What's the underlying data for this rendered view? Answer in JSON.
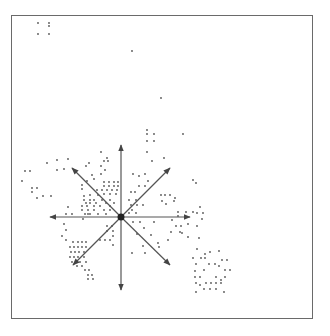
{
  "diagram": {
    "type": "scatter-with-direction-star",
    "frame": {
      "x": 11,
      "y": 15,
      "width": 302,
      "height": 304,
      "stroke": "#6a6a6a"
    },
    "colors": {
      "dot": "#555555",
      "arrow": "#555555",
      "center": "#222222"
    },
    "star": {
      "center": [
        121,
        217
      ],
      "arrows": [
        {
          "name": "north",
          "to": [
            121,
            145
          ]
        },
        {
          "name": "south",
          "to": [
            121,
            290
          ]
        },
        {
          "name": "west",
          "to": [
            50,
            217
          ]
        },
        {
          "name": "east",
          "to": [
            190,
            217
          ]
        },
        {
          "name": "north-west",
          "to": [
            72,
            168
          ]
        },
        {
          "name": "north-east",
          "to": [
            170,
            168
          ]
        },
        {
          "name": "south-west",
          "to": [
            73,
            265
          ]
        },
        {
          "name": "south-east",
          "to": [
            170,
            265
          ]
        }
      ]
    },
    "dots": [
      [
        38,
        23
      ],
      [
        49,
        23
      ],
      [
        49,
        26
      ],
      [
        38,
        34
      ],
      [
        49,
        34
      ],
      [
        132,
        51
      ],
      [
        161,
        98
      ],
      [
        147,
        130
      ],
      [
        147,
        134
      ],
      [
        154,
        134
      ],
      [
        147,
        141
      ],
      [
        154,
        141
      ],
      [
        147,
        152
      ],
      [
        183,
        134
      ],
      [
        164,
        158
      ],
      [
        152,
        161
      ],
      [
        57,
        170
      ],
      [
        64,
        169
      ],
      [
        68,
        159
      ],
      [
        57,
        160
      ],
      [
        47,
        163
      ],
      [
        25,
        171
      ],
      [
        30,
        171
      ],
      [
        22,
        181
      ],
      [
        101,
        152
      ],
      [
        107,
        158
      ],
      [
        104,
        161
      ],
      [
        101,
        166
      ],
      [
        108,
        161
      ],
      [
        105,
        170
      ],
      [
        101,
        174
      ],
      [
        86,
        166
      ],
      [
        89,
        163
      ],
      [
        92,
        175
      ],
      [
        87,
        181
      ],
      [
        94,
        179
      ],
      [
        82,
        185
      ],
      [
        82,
        189
      ],
      [
        104,
        182
      ],
      [
        109,
        182
      ],
      [
        114,
        182
      ],
      [
        118,
        182
      ],
      [
        104,
        186
      ],
      [
        109,
        186
      ],
      [
        114,
        186
      ],
      [
        118,
        186
      ],
      [
        97,
        190
      ],
      [
        102,
        190
      ],
      [
        107,
        190
      ],
      [
        112,
        190
      ],
      [
        117,
        190
      ],
      [
        90,
        195
      ],
      [
        98,
        195
      ],
      [
        104,
        194
      ],
      [
        110,
        194
      ],
      [
        116,
        194
      ],
      [
        32,
        188
      ],
      [
        32,
        192
      ],
      [
        37,
        188
      ],
      [
        37,
        198
      ],
      [
        43,
        196
      ],
      [
        51,
        196
      ],
      [
        84,
        196
      ],
      [
        84,
        200
      ],
      [
        90,
        200
      ],
      [
        94,
        200
      ],
      [
        102,
        200
      ],
      [
        110,
        200
      ],
      [
        86,
        203
      ],
      [
        90,
        203
      ],
      [
        96,
        203
      ],
      [
        106,
        203
      ],
      [
        114,
        203
      ],
      [
        82,
        206
      ],
      [
        87,
        206
      ],
      [
        94,
        206
      ],
      [
        100,
        206
      ],
      [
        110,
        206
      ],
      [
        82,
        210
      ],
      [
        88,
        210
      ],
      [
        94,
        210
      ],
      [
        104,
        210
      ],
      [
        110,
        210
      ],
      [
        85,
        214
      ],
      [
        90,
        214
      ],
      [
        98,
        214
      ],
      [
        106,
        214
      ],
      [
        68,
        207
      ],
      [
        72,
        214
      ],
      [
        66,
        214
      ],
      [
        83,
        219
      ],
      [
        88,
        214
      ],
      [
        133,
        174
      ],
      [
        139,
        176
      ],
      [
        145,
        174
      ],
      [
        148,
        181
      ],
      [
        139,
        186
      ],
      [
        145,
        186
      ],
      [
        131,
        192
      ],
      [
        135,
        192
      ],
      [
        129,
        200
      ],
      [
        136,
        200
      ],
      [
        131,
        205
      ],
      [
        137,
        205
      ],
      [
        143,
        205
      ],
      [
        132,
        210
      ],
      [
        129,
        213
      ],
      [
        136,
        213
      ],
      [
        161,
        195
      ],
      [
        165,
        195
      ],
      [
        170,
        195
      ],
      [
        175,
        198
      ],
      [
        162,
        201
      ],
      [
        166,
        204
      ],
      [
        174,
        201
      ],
      [
        178,
        212
      ],
      [
        178,
        216
      ],
      [
        186,
        212
      ],
      [
        186,
        217
      ],
      [
        193,
        212
      ],
      [
        200,
        207
      ],
      [
        197,
        213
      ],
      [
        203,
        213
      ],
      [
        202,
        219
      ],
      [
        197,
        226
      ],
      [
        196,
        183
      ],
      [
        193,
        180
      ],
      [
        64,
        224
      ],
      [
        66,
        230
      ],
      [
        62,
        236
      ],
      [
        66,
        240
      ],
      [
        107,
        226
      ],
      [
        112,
        226
      ],
      [
        107,
        231
      ],
      [
        113,
        231
      ],
      [
        100,
        240
      ],
      [
        105,
        240
      ],
      [
        110,
        240
      ],
      [
        113,
        236
      ],
      [
        113,
        245
      ],
      [
        133,
        222
      ],
      [
        140,
        222
      ],
      [
        144,
        228
      ],
      [
        137,
        234
      ],
      [
        151,
        235
      ],
      [
        154,
        222
      ],
      [
        172,
        220
      ],
      [
        176,
        226
      ],
      [
        171,
        232
      ],
      [
        168,
        240
      ],
      [
        159,
        247
      ],
      [
        181,
        226
      ],
      [
        188,
        224
      ],
      [
        182,
        233
      ],
      [
        188,
        237
      ],
      [
        143,
        246
      ],
      [
        158,
        243
      ],
      [
        180,
        232
      ],
      [
        73,
        242
      ],
      [
        78,
        242
      ],
      [
        82,
        242
      ],
      [
        86,
        242
      ],
      [
        70,
        247
      ],
      [
        74,
        247
      ],
      [
        78,
        247
      ],
      [
        82,
        247
      ],
      [
        86,
        247
      ],
      [
        71,
        252
      ],
      [
        75,
        252
      ],
      [
        79,
        252
      ],
      [
        84,
        252
      ],
      [
        70,
        257
      ],
      [
        74,
        257
      ],
      [
        78,
        257
      ],
      [
        84,
        257
      ],
      [
        72,
        262
      ],
      [
        80,
        262
      ],
      [
        86,
        262
      ],
      [
        77,
        266
      ],
      [
        82,
        266
      ],
      [
        85,
        270
      ],
      [
        89,
        270
      ],
      [
        88,
        275
      ],
      [
        92,
        275
      ],
      [
        88,
        279
      ],
      [
        93,
        279
      ],
      [
        132,
        253
      ],
      [
        145,
        253
      ],
      [
        199,
        238
      ],
      [
        197,
        249
      ],
      [
        205,
        254
      ],
      [
        201,
        258
      ],
      [
        196,
        264
      ],
      [
        193,
        258
      ],
      [
        205,
        258
      ],
      [
        195,
        271
      ],
      [
        204,
        270
      ],
      [
        209,
        264
      ],
      [
        215,
        264
      ],
      [
        219,
        266
      ],
      [
        195,
        277
      ],
      [
        200,
        277
      ],
      [
        216,
        277
      ],
      [
        221,
        280
      ],
      [
        225,
        277
      ],
      [
        196,
        283
      ],
      [
        200,
        285
      ],
      [
        206,
        283
      ],
      [
        211,
        283
      ],
      [
        216,
        283
      ],
      [
        221,
        283
      ],
      [
        204,
        289
      ],
      [
        210,
        289
      ],
      [
        216,
        289
      ],
      [
        196,
        292
      ],
      [
        224,
        292
      ],
      [
        210,
        252
      ],
      [
        219,
        251
      ],
      [
        222,
        260
      ],
      [
        227,
        260
      ],
      [
        225,
        270
      ],
      [
        230,
        270
      ]
    ]
  }
}
